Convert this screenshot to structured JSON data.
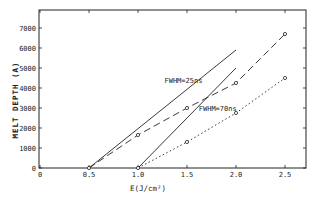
{
  "chart_data": {
    "type": "line",
    "title": "",
    "xlabel": "E(J/cm²)",
    "ylabel": "MELT DEPTH (A)",
    "xlim": [
      0,
      2.7
    ],
    "ylim": [
      0,
      7700
    ],
    "xticks": [
      0,
      0.5,
      1.0,
      1.5,
      2.0,
      2.5
    ],
    "xtick_labels": [
      "0",
      "0.5",
      "1.0",
      "1.5",
      "2.0",
      "2.5"
    ],
    "yticks": [
      0,
      1000,
      2000,
      3000,
      4000,
      5000,
      6000,
      7000
    ],
    "ytick_labels": [
      "0",
      "1000",
      "2000",
      "3000",
      "4000",
      "5000",
      "6000",
      "7000"
    ],
    "grid": false,
    "series": [
      {
        "name": "FWHM=25ns theory",
        "style": "solid",
        "markers": false,
        "x": [
          0.5,
          2.0
        ],
        "y": [
          0,
          5900
        ]
      },
      {
        "name": "FWHM=25ns data",
        "style": "dashed",
        "markers": true,
        "x": [
          0.5,
          1.0,
          1.5,
          2.0,
          2.5
        ],
        "y": [
          0,
          1650,
          3000,
          4250,
          6700
        ]
      },
      {
        "name": "FWHM=70ns theory",
        "style": "solid",
        "markers": false,
        "x": [
          1.0,
          2.0
        ],
        "y": [
          0,
          5000
        ]
      },
      {
        "name": "FWHM=70ns data",
        "style": "dotted",
        "markers": true,
        "x": [
          1.0,
          1.5,
          2.0,
          2.5
        ],
        "y": [
          0,
          1300,
          2750,
          4500
        ]
      }
    ],
    "annotations": [
      {
        "text": "FWHM=25ns",
        "x": 1.27,
        "y": 4250
      },
      {
        "text": "FWHM=70ns",
        "x": 1.62,
        "y": 2850
      }
    ]
  }
}
